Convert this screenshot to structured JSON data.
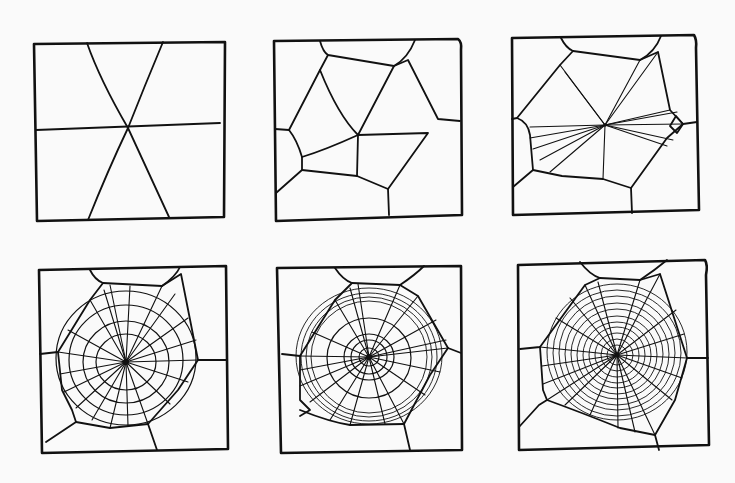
{
  "figure": {
    "colors": {
      "background": "#fafafa",
      "ink": "#111111"
    },
    "panels": [
      {
        "id": 1,
        "stage": "initial-radii",
        "label": ""
      },
      {
        "id": 2,
        "stage": "frame-threads",
        "label": ""
      },
      {
        "id": 3,
        "stage": "adding-radii",
        "label": ""
      },
      {
        "id": 4,
        "stage": "temporary-spiral",
        "label": ""
      },
      {
        "id": 5,
        "stage": "sticky-spiral-begins",
        "label": ""
      },
      {
        "id": 6,
        "stage": "completed-web",
        "label": ""
      }
    ]
  }
}
